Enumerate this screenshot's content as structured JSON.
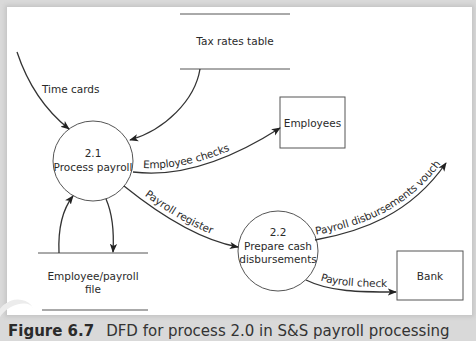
{
  "diagram": {
    "processes": [
      {
        "id": "2.1",
        "number": "2.1",
        "name": "Process payroll"
      },
      {
        "id": "2.2",
        "number": "2.2",
        "name_line1": "Prepare cash",
        "name_line2": "disbursements"
      }
    ],
    "data_stores": [
      {
        "name": "Tax rates table"
      },
      {
        "name_line1": "Employee/payroll",
        "name_line2": "file"
      }
    ],
    "external_entities": [
      {
        "name": "Employees"
      },
      {
        "name": "Bank"
      }
    ],
    "flows": [
      {
        "label": "Time cards",
        "from": "external",
        "to": "2.1"
      },
      {
        "label": "",
        "from": "Tax rates table",
        "to": "2.1"
      },
      {
        "label": "Employee checks",
        "from": "2.1",
        "to": "Employees"
      },
      {
        "label": "Payroll register",
        "from": "2.1",
        "to": "2.2"
      },
      {
        "label": "",
        "from": "Employee/payroll file",
        "to": "2.1"
      },
      {
        "label": "",
        "from": "2.1",
        "to": "Employee/payroll file"
      },
      {
        "label": "Payroll disbursements voucher",
        "from": "2.2",
        "to": "external"
      },
      {
        "label": "Payroll check",
        "from": "2.2",
        "to": "Bank"
      }
    ]
  },
  "caption": {
    "figure": "Figure 6.7",
    "text": "DFD for process 2.0 in S&S payroll processing"
  },
  "colors": {
    "line": "#333333",
    "background": "#ffffff",
    "frame": "#d9d9d9"
  }
}
